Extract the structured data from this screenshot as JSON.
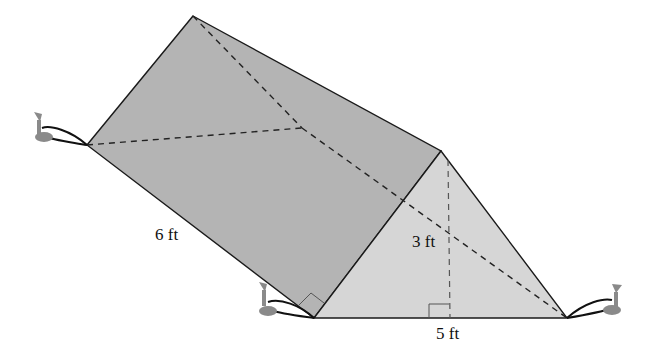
{
  "figure": {
    "type": "triangular prism tent",
    "labels": {
      "length": "6 ft",
      "height": "3 ft",
      "base": "5 ft"
    },
    "colors": {
      "side_face": "#b4b4b4",
      "front_face": "#d6d6d6",
      "edge": "#1a1a1a",
      "stake": "#8a8a8a"
    }
  }
}
